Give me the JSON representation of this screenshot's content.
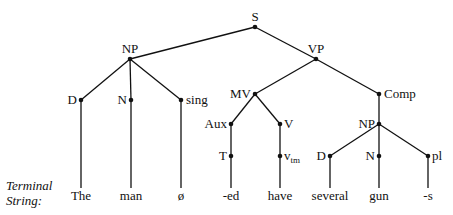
{
  "diagram": {
    "type": "phrase-structure-tree",
    "caption_label": [
      "Terminal",
      "String:"
    ],
    "nodes": [
      {
        "id": "S",
        "label": "S",
        "x": 255,
        "y": 27,
        "lx": 255,
        "ly": 21,
        "anchor": "middle"
      },
      {
        "id": "NP1",
        "label": "NP",
        "x": 130,
        "y": 59,
        "lx": 130,
        "ly": 53,
        "anchor": "middle"
      },
      {
        "id": "VP",
        "label": "VP",
        "x": 316,
        "y": 59,
        "lx": 316,
        "ly": 53,
        "anchor": "middle"
      },
      {
        "id": "D1",
        "label": "D",
        "x": 81,
        "y": 100,
        "lx": 77,
        "ly": 104,
        "anchor": "end"
      },
      {
        "id": "N1",
        "label": "N",
        "x": 131,
        "y": 100,
        "lx": 127,
        "ly": 104,
        "anchor": "end"
      },
      {
        "id": "sing",
        "label": "sing",
        "x": 181,
        "y": 100,
        "lx": 186,
        "ly": 104,
        "anchor": "start"
      },
      {
        "id": "MV",
        "label": "MV",
        "x": 255,
        "y": 94,
        "lx": 251,
        "ly": 98,
        "anchor": "end"
      },
      {
        "id": "Comp",
        "label": "Comp",
        "x": 379,
        "y": 94,
        "lx": 384,
        "ly": 98,
        "anchor": "start"
      },
      {
        "id": "Aux",
        "label": "Aux",
        "x": 231,
        "y": 124,
        "lx": 227,
        "ly": 128,
        "anchor": "end"
      },
      {
        "id": "V",
        "label": "V",
        "x": 280,
        "y": 124,
        "lx": 284,
        "ly": 128,
        "anchor": "start"
      },
      {
        "id": "NP2",
        "label": "NP",
        "x": 379,
        "y": 124,
        "lx": 375,
        "ly": 128,
        "anchor": "end"
      },
      {
        "id": "T",
        "label": "T",
        "x": 231,
        "y": 156,
        "lx": 227,
        "ly": 160,
        "anchor": "end"
      },
      {
        "id": "vtm",
        "label": "v",
        "sub": "tm",
        "x": 280,
        "y": 156,
        "lx": 284,
        "ly": 160,
        "anchor": "start"
      },
      {
        "id": "D2",
        "label": "D",
        "x": 330,
        "y": 156,
        "lx": 326,
        "ly": 160,
        "anchor": "end"
      },
      {
        "id": "N2",
        "label": "N",
        "x": 379,
        "y": 156,
        "lx": 375,
        "ly": 160,
        "anchor": "end"
      },
      {
        "id": "pl",
        "label": "pl",
        "x": 428,
        "y": 156,
        "lx": 432,
        "ly": 160,
        "anchor": "start"
      }
    ],
    "edges": [
      [
        "S",
        "NP1"
      ],
      [
        "S",
        "VP"
      ],
      [
        "NP1",
        "D1"
      ],
      [
        "NP1",
        "N1"
      ],
      [
        "NP1",
        "sing"
      ],
      [
        "VP",
        "MV"
      ],
      [
        "VP",
        "Comp"
      ],
      [
        "MV",
        "Aux"
      ],
      [
        "MV",
        "V"
      ],
      [
        "Aux",
        "T"
      ],
      [
        "V",
        "vtm"
      ],
      [
        "Comp",
        "NP2"
      ],
      [
        "NP2",
        "D2"
      ],
      [
        "NP2",
        "N2"
      ],
      [
        "NP2",
        "pl"
      ]
    ],
    "terminals": [
      {
        "parent": "D1",
        "word": "The",
        "x": 81
      },
      {
        "parent": "N1",
        "word": "man",
        "x": 131
      },
      {
        "parent": "sing",
        "word": "ø",
        "x": 181
      },
      {
        "parent": "T",
        "word": "-ed",
        "x": 231
      },
      {
        "parent": "vtm",
        "word": "have",
        "x": 280
      },
      {
        "parent": "D2",
        "word": "several",
        "x": 330
      },
      {
        "parent": "N2",
        "word": "gun",
        "x": 379
      },
      {
        "parent": "pl",
        "word": "-s",
        "x": 428
      }
    ],
    "terminal_line_bottom": 188,
    "terminal_word_baseline": 200
  }
}
